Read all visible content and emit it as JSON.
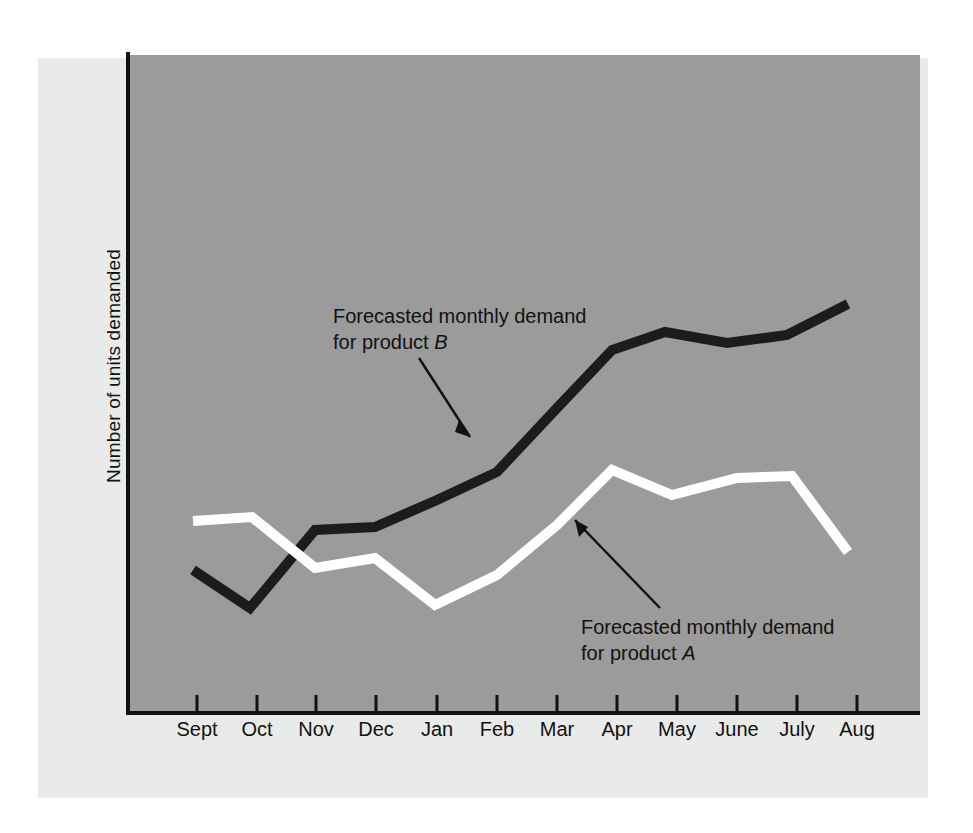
{
  "figure": {
    "background": "#ffffff",
    "mat_color": "#e9eaea",
    "plot_background": "#9b9b9b",
    "axis_color": "#111111"
  },
  "axes": {
    "y_title": "Number of units demanded",
    "x_title": ""
  },
  "annotations": {
    "series_b": {
      "line1": "Forecasted monthly demand",
      "line2_prefix": "for product ",
      "line2_symbol": "B"
    },
    "series_a": {
      "line1": "Forecasted monthly demand",
      "line2_prefix": "for product ",
      "line2_symbol": "A"
    }
  },
  "chart_data": {
    "type": "line",
    "title": "",
    "xlabel": "",
    "ylabel": "Number of units demanded",
    "grid": false,
    "legend": "annotated-inline",
    "categories": [
      "Sept",
      "Oct",
      "Nov",
      "Dec",
      "Jan",
      "Feb",
      "Mar",
      "Apr",
      "May",
      "June",
      "July",
      "Aug"
    ],
    "ylim": [
      0,
      100
    ],
    "y_ticks": [],
    "series": [
      {
        "name": "Forecasted monthly demand for product A",
        "color": "#ffffff",
        "values": [
          30,
          31,
          23,
          25,
          17,
          22,
          30,
          38,
          34,
          37,
          37,
          25
        ]
      },
      {
        "name": "Forecasted monthly demand for product B",
        "color": "#1c1c1c",
        "values": [
          23,
          17,
          29,
          30,
          34,
          38,
          48,
          57,
          60,
          58,
          60,
          65
        ]
      }
    ]
  },
  "geometry": {
    "plot": {
      "left": 130,
      "top": 55,
      "right": 920,
      "bottom": 712
    },
    "x_positions": [
      197,
      257,
      316,
      376,
      437,
      497,
      557,
      617,
      677,
      737,
      797,
      857
    ],
    "series_b_points": "193,570 250,608 315,530 375,527 437,500 497,472 557,408 612,350 665,332 727,343 787,335 848,304",
    "series_a_points": "193,521 252,517 315,568 375,558 435,605 497,575 557,525 612,470 672,495 737,478 792,476 848,552",
    "leader_b": {
      "path": "M 419,358 L 470,437",
      "head": "470,437 459,420 455,432"
    },
    "leader_a": {
      "path": "M 660,608 L 575,520",
      "head": "575,520 588,527 579,537"
    }
  }
}
